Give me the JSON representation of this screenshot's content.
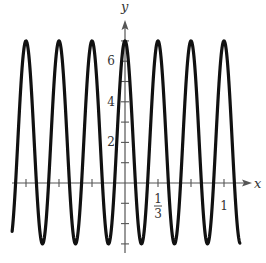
{
  "chart_data": {
    "type": "line",
    "title": "",
    "xlabel": "x",
    "ylabel": "y",
    "function": "y = 2 + 5cos(6πx)",
    "xlim": [
      -1.14,
      1.16
    ],
    "ylim": [
      -3.5,
      7.5
    ],
    "grid": false,
    "legend": null,
    "x_ticks": [
      -1,
      -0.6667,
      -0.3333,
      0.3333,
      0.6667,
      1
    ],
    "x_tick_labels": [
      {
        "value": 0.3333,
        "num": "1",
        "den": "3"
      },
      {
        "value": 1,
        "text": "1"
      }
    ],
    "y_ticks": [
      -3,
      -2,
      -1,
      1,
      2,
      3,
      4,
      5,
      6,
      7
    ],
    "y_tick_labels": [
      {
        "value": 2,
        "text": "2"
      },
      {
        "value": 4,
        "text": "4"
      },
      {
        "value": 6,
        "text": "6"
      }
    ],
    "series": [
      {
        "name": "y = 2 + 5cos(6πx)",
        "midline": 2,
        "amplitude": 5,
        "period": 0.3333,
        "x_range": [
          -1.14,
          1.16
        ],
        "max": 7,
        "min": -3,
        "peaks_x": [
          -1,
          -0.6667,
          -0.3333,
          0,
          0.3333,
          0.6667,
          1
        ],
        "troughs_x": [
          -0.8333,
          -0.5,
          -0.1667,
          0.1667,
          0.5,
          0.8333
        ],
        "color": "#111111"
      }
    ]
  },
  "style": {
    "axis_color": "#555555",
    "curve_color": "#111111"
  }
}
